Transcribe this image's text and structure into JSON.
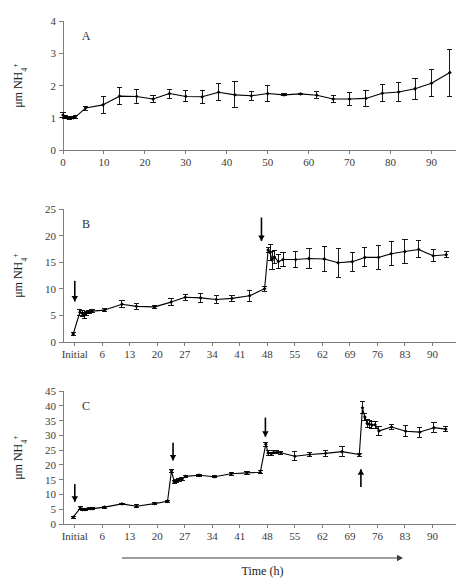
{
  "figure": {
    "axis_title_x": "Time (h)",
    "axis_title_y": "μm NH",
    "axis_title_y_sub": "4",
    "axis_title_y_sup": "+",
    "ink_color": "#000000",
    "axis_color": "#7d7d7d"
  },
  "chart_data": [
    {
      "type": "line",
      "panel": "A",
      "title": "A",
      "xlabel": "",
      "ylabel": "μm NH4+",
      "xlim": [
        0,
        96
      ],
      "ylim": [
        0,
        4
      ],
      "yticks": [
        0,
        1,
        2,
        3,
        4
      ],
      "xticks": [
        0,
        10,
        20,
        30,
        40,
        50,
        60,
        70,
        80,
        90
      ],
      "xticklabels": [
        "0",
        "10",
        "20",
        "30",
        "40",
        "50",
        "60",
        "70",
        "80",
        "90"
      ],
      "grid": false,
      "legend": "none",
      "marker": "filled-diamond",
      "errorbars": true,
      "x": [
        0,
        0.5,
        1,
        1.5,
        2,
        2.5,
        3,
        5.5,
        9.8,
        13.8,
        18,
        22,
        26,
        30,
        34,
        38,
        42,
        46,
        50,
        54,
        58,
        62,
        66,
        70,
        74,
        78,
        82,
        86,
        90,
        94.5
      ],
      "values": [
        1.08,
        1.02,
        1.0,
        0.99,
        1.0,
        1.0,
        1.02,
        1.3,
        1.4,
        1.67,
        1.66,
        1.58,
        1.75,
        1.66,
        1.65,
        1.79,
        1.71,
        1.68,
        1.75,
        1.71,
        1.74,
        1.7,
        1.58,
        1.58,
        1.6,
        1.76,
        1.8,
        1.9,
        2.07,
        2.4
      ],
      "errors": [
        0.08,
        0.05,
        0.03,
        0.03,
        0.03,
        0.03,
        0.04,
        0.06,
        0.26,
        0.27,
        0.22,
        0.12,
        0.14,
        0.17,
        0.2,
        0.27,
        0.4,
        0.13,
        0.25,
        0.03,
        0.01,
        0.1,
        0.11,
        0.2,
        0.25,
        0.27,
        0.29,
        0.33,
        0.42,
        0.73
      ]
    },
    {
      "type": "line",
      "panel": "B",
      "title": "B",
      "xlabel": "",
      "ylabel": "μm NH4+",
      "xlim": [
        -4,
        96
      ],
      "ylim": [
        0,
        25
      ],
      "yticks": [
        0,
        5,
        10,
        15,
        20,
        25
      ],
      "xticks": [
        -1,
        6,
        13,
        20,
        27,
        34,
        41,
        48,
        55,
        62,
        69,
        76,
        83,
        90
      ],
      "xticklabels": [
        "Initial",
        "6",
        "13",
        "20",
        "27",
        "34",
        "41",
        "48",
        "55",
        "62",
        "69",
        "76",
        "83",
        "90"
      ],
      "grid": false,
      "legend": "none",
      "marker": "filled-diamond",
      "errorbars": true,
      "arrows": [
        {
          "x": -1.0,
          "y_tip": 7.6,
          "y_tail": 11.5,
          "direction": "down",
          "label": "feed-event-0h"
        },
        {
          "x": 46.5,
          "y_tip": 19.0,
          "y_tail": 23.4,
          "direction": "down",
          "label": "feed-event-48h"
        }
      ],
      "x": [
        -1.4,
        0.3,
        0.9,
        1.4,
        1.9,
        2.6,
        3.4,
        6.6,
        11.0,
        14.7,
        19.3,
        23.5,
        27.1,
        31.0,
        35.0,
        39.0,
        43.5,
        47.3,
        48.2,
        48.7,
        49.2,
        49.8,
        50.8,
        52.0,
        55.2,
        58.6,
        62.5,
        66.0,
        69.6,
        72.8,
        76.3,
        79.5,
        83.0,
        86.5,
        90.2,
        93.5
      ],
      "values": [
        1.5,
        5.6,
        5.4,
        5.0,
        5.4,
        5.6,
        5.8,
        6.0,
        7.1,
        6.7,
        6.6,
        7.5,
        8.4,
        8.3,
        8.0,
        8.2,
        8.7,
        10.0,
        17.3,
        16.8,
        15.4,
        16.0,
        15.1,
        15.5,
        15.5,
        15.7,
        15.6,
        14.9,
        15.1,
        15.9,
        15.9,
        16.6,
        17.0,
        17.4,
        16.2,
        16.4
      ],
      "errors": [
        0.35,
        0.55,
        0.55,
        0.6,
        0.4,
        0.3,
        0.25,
        0.25,
        0.7,
        0.5,
        0.3,
        0.7,
        0.6,
        0.9,
        0.7,
        0.5,
        1.0,
        0.45,
        0.45,
        1.5,
        1.7,
        1.2,
        1.3,
        1.4,
        1.5,
        1.8,
        2.4,
        2.7,
        1.8,
        1.8,
        2.2,
        2.3,
        2.3,
        1.6,
        1.1,
        0.6
      ]
    },
    {
      "type": "line",
      "panel": "C",
      "title": "C",
      "xlabel": "Time (h)",
      "ylabel": "μm NH4+",
      "xlim": [
        -4,
        96
      ],
      "ylim": [
        0,
        45
      ],
      "yticks": [
        0,
        5,
        10,
        15,
        20,
        25,
        30,
        35,
        40,
        45
      ],
      "xticks": [
        -1,
        6,
        13,
        20,
        27,
        34,
        41,
        48,
        55,
        62,
        69,
        76,
        83,
        90
      ],
      "xticklabels": [
        "Initial",
        "6",
        "13",
        "20",
        "27",
        "34",
        "41",
        "48",
        "55",
        "62",
        "69",
        "76",
        "83",
        "90"
      ],
      "grid": false,
      "legend": "none",
      "marker": "filled-diamond",
      "errorbars": true,
      "arrows": [
        {
          "x": -1.0,
          "y_tip": 7.5,
          "y_tail": 13.5,
          "direction": "down",
          "label": "feed-event-0h"
        },
        {
          "x": 24.0,
          "y_tip": 21.5,
          "y_tail": 27.5,
          "direction": "down",
          "label": "feed-event-24h"
        },
        {
          "x": 47.5,
          "y_tip": 29.5,
          "y_tail": 36.0,
          "direction": "down",
          "label": "feed-event-48h"
        },
        {
          "x": 71.8,
          "y_tip": 18.5,
          "y_tail": 12.5,
          "direction": "up",
          "label": "feed-event-72h"
        }
      ],
      "x": [
        -1.4,
        0.4,
        1.0,
        1.6,
        2.2,
        2.9,
        3.6,
        6.6,
        11.0,
        14.7,
        19.3,
        22.6,
        23.6,
        24.3,
        24.9,
        25.5,
        26.3,
        27.2,
        30.6,
        34.6,
        38.8,
        42.8,
        46.2,
        47.6,
        48.2,
        49.0,
        49.6,
        50.4,
        51.4,
        55.0,
        58.8,
        62.8,
        67.0,
        71.4,
        72.2,
        72.8,
        73.4,
        73.9,
        74.6,
        75.4,
        76.4,
        79.6,
        83.2,
        86.8,
        90.4,
        93.4
      ],
      "values": [
        2.3,
        5.4,
        4.9,
        4.9,
        5.1,
        5.2,
        5.2,
        5.7,
        6.8,
        6.0,
        6.9,
        7.7,
        18.0,
        14.3,
        14.6,
        15.0,
        15.2,
        16.1,
        16.5,
        16.0,
        17.0,
        17.3,
        17.5,
        27.0,
        24.0,
        23.8,
        24.2,
        24.3,
        24.1,
        22.9,
        23.5,
        23.9,
        24.5,
        23.5,
        39.3,
        36.2,
        34.0,
        33.8,
        33.5,
        33.6,
        31.5,
        32.8,
        31.4,
        31.1,
        32.6,
        32.1
      ],
      "errors": [
        0.4,
        0.55,
        0.5,
        0.4,
        0.3,
        0.3,
        0.3,
        0.3,
        0.3,
        0.55,
        0.25,
        0.4,
        0.5,
        0.5,
        0.5,
        0.5,
        0.5,
        0.25,
        0.3,
        0.35,
        0.45,
        0.4,
        0.45,
        0.7,
        0.8,
        0.5,
        0.5,
        0.45,
        0.5,
        1.5,
        0.6,
        0.9,
        1.6,
        0.5,
        2.0,
        1.3,
        1.2,
        1.2,
        1.3,
        1.2,
        1.6,
        0.8,
        1.8,
        1.7,
        1.6,
        0.9
      ]
    }
  ]
}
